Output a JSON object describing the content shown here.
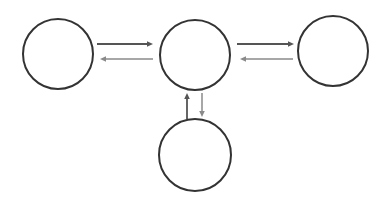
{
  "diagram": {
    "width": 389,
    "height": 204,
    "background": "#ffffff",
    "node_stroke": "#333333",
    "node_stroke_width": 2,
    "nodes": [
      {
        "id": "left",
        "cx": 58,
        "cy": 54,
        "r": 35,
        "label": ""
      },
      {
        "id": "center",
        "cx": 195,
        "cy": 55,
        "r": 35,
        "label": ""
      },
      {
        "id": "right",
        "cx": 333,
        "cy": 51,
        "r": 35,
        "label": ""
      },
      {
        "id": "bottom",
        "cx": 195,
        "cy": 155,
        "r": 36,
        "label": ""
      }
    ],
    "edges": [
      {
        "id": "left-to-center",
        "from": "left",
        "to": "center",
        "x1": 97,
        "y1": 44,
        "x2": 153,
        "y2": 44,
        "color": "#555555",
        "width": 1.8
      },
      {
        "id": "center-to-left",
        "from": "center",
        "to": "left",
        "x1": 153,
        "y1": 59,
        "x2": 100,
        "y2": 59,
        "color": "#8a8a8a",
        "width": 1.5
      },
      {
        "id": "center-to-right",
        "from": "center",
        "to": "right",
        "x1": 237,
        "y1": 44,
        "x2": 294,
        "y2": 44,
        "color": "#555555",
        "width": 1.8
      },
      {
        "id": "right-to-center",
        "from": "right",
        "to": "center",
        "x1": 293,
        "y1": 59,
        "x2": 240,
        "y2": 59,
        "color": "#8a8a8a",
        "width": 1.5
      },
      {
        "id": "bottom-to-center",
        "from": "bottom",
        "to": "center",
        "x1": 187,
        "y1": 119,
        "x2": 187,
        "y2": 93,
        "color": "#555555",
        "width": 1.8
      },
      {
        "id": "center-to-bottom",
        "from": "center",
        "to": "bottom",
        "x1": 202,
        "y1": 93,
        "x2": 202,
        "y2": 117,
        "color": "#8a8a8a",
        "width": 1.5
      }
    ]
  }
}
